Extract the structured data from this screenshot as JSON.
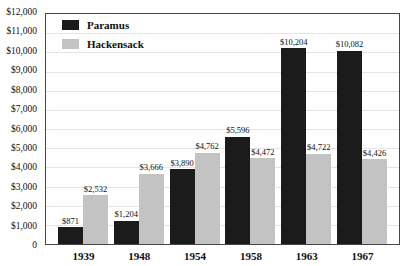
{
  "chart_data": {
    "type": "bar",
    "title": "",
    "categories": [
      "1939",
      "1948",
      "1954",
      "1958",
      "1963",
      "1967"
    ],
    "series": [
      {
        "name": "Paramus",
        "color": "#1b1b1b",
        "values": [
          871,
          1204,
          3890,
          5596,
          10204,
          10082
        ],
        "labels": [
          "$871",
          "$1,204",
          "$3,890",
          "$5,596",
          "$10,204",
          "$10,082"
        ]
      },
      {
        "name": "Hackensack",
        "color": "#c3c3c3",
        "values": [
          2532,
          3666,
          4762,
          4472,
          4722,
          4426
        ],
        "labels": [
          "$2,532",
          "$3,666",
          "$4,762",
          "$4,472",
          "$4,722",
          "$4,426"
        ]
      }
    ],
    "xlabel": "",
    "ylabel": "",
    "ylim": [
      0,
      12000
    ],
    "ytick_step": 1000,
    "yticks": [
      {
        "value": 12000,
        "label": "$12,000"
      },
      {
        "value": 11000,
        "label": "$11,000"
      },
      {
        "value": 10000,
        "label": "$10,000"
      },
      {
        "value": 9000,
        "label": "$9,000"
      },
      {
        "value": 8000,
        "label": "$8,000"
      },
      {
        "value": 7000,
        "label": "$7,000"
      },
      {
        "value": 6000,
        "label": "$6,000"
      },
      {
        "value": 5000,
        "label": "$5,000"
      },
      {
        "value": 4000,
        "label": "$4,000"
      },
      {
        "value": 3000,
        "label": "$3,000"
      },
      {
        "value": 2000,
        "label": "$2,000"
      },
      {
        "value": 1000,
        "label": "$1,000"
      },
      {
        "value": 0,
        "label": "0"
      }
    ],
    "grid": true,
    "legend_position": "top-left",
    "styles": {
      "grid_color": "#e5e5e5",
      "border_color": "#474747",
      "text_color": "#111111",
      "background": "#ffffff"
    }
  }
}
